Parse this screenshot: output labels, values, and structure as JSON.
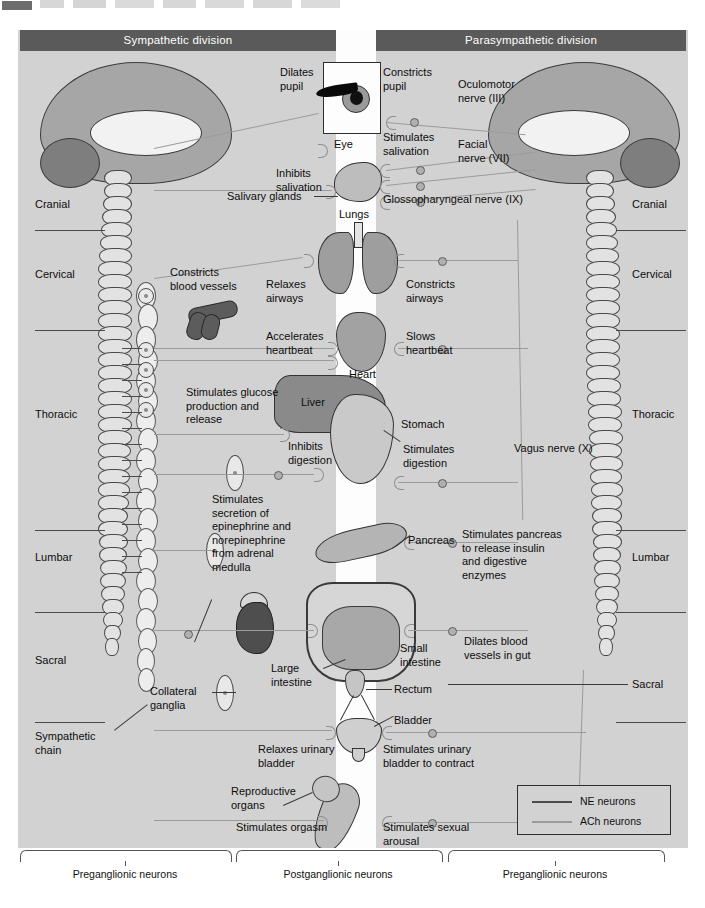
{
  "figure": {
    "banners": {
      "sympathetic": "Sympathetic division",
      "parasympathetic": "Parasympathetic division"
    },
    "spinal_regions_left": [
      "Cranial",
      "Cervical",
      "Thoracic",
      "Lumbar",
      "Sacral"
    ],
    "spinal_regions_right": [
      "Cranial",
      "Cervical",
      "Thoracic",
      "Lumbar",
      "Sacral"
    ],
    "structure_labels_left": {
      "sympathetic_chain": "Sympathetic\nchain",
      "collateral_ganglia": "Collateral\nganglia"
    },
    "organ_labels": [
      {
        "id": "eye",
        "text": "Eye"
      },
      {
        "id": "salivary-glands",
        "text": "Salivary glands"
      },
      {
        "id": "lungs",
        "text": "Lungs"
      },
      {
        "id": "heart",
        "text": "Heart"
      },
      {
        "id": "liver",
        "text": "Liver"
      },
      {
        "id": "stomach",
        "text": "Stomach"
      },
      {
        "id": "pancreas",
        "text": "Pancreas"
      },
      {
        "id": "small-intestine",
        "text": "Small\nintestine"
      },
      {
        "id": "large-intestine",
        "text": "Large\nintestine"
      },
      {
        "id": "rectum",
        "text": "Rectum"
      },
      {
        "id": "bladder",
        "text": "Bladder"
      },
      {
        "id": "reproductive-organs",
        "text": "Reproductive\norgans"
      }
    ],
    "sympathetic_effects": [
      {
        "id": "dilates-pupil",
        "text": "Dilates\npupil"
      },
      {
        "id": "inhibits-salivation",
        "text": "Inhibits\nsalivation"
      },
      {
        "id": "constricts-blood-vessels",
        "text": "Constricts\nblood vessels"
      },
      {
        "id": "relaxes-airways",
        "text": "Relaxes\nairways"
      },
      {
        "id": "accelerates-heartbeat",
        "text": "Accelerates\nheartbeat"
      },
      {
        "id": "stimulates-glucose",
        "text": "Stimulates glucose\nproduction and\nrelease"
      },
      {
        "id": "inhibits-digestion",
        "text": "Inhibits\ndigestion"
      },
      {
        "id": "stimulates-adrenal",
        "text": "Stimulates\nsecretion of\nepinephrine and\nnorepinephrine\nfrom adrenal\nmedulla"
      },
      {
        "id": "relaxes-urinary-bladder",
        "text": "Relaxes urinary\nbladder"
      },
      {
        "id": "stimulates-orgasm",
        "text": "Stimulates orgasm"
      }
    ],
    "parasympathetic_effects": [
      {
        "id": "constricts-pupil",
        "text": "Constricts\npupil"
      },
      {
        "id": "stimulates-salivation",
        "text": "Stimulates\nsalivation"
      },
      {
        "id": "constricts-airways",
        "text": "Constricts\nairways"
      },
      {
        "id": "slows-heartbeat",
        "text": "Slows\nheartbeat"
      },
      {
        "id": "stimulates-digestion",
        "text": "Stimulates\ndigestion"
      },
      {
        "id": "stimulates-pancreas",
        "text": "Stimulates pancreas\nto release insulin\nand digestive\nenzymes"
      },
      {
        "id": "dilates-blood-vessels-gut",
        "text": "Dilates blood\nvessels in gut"
      },
      {
        "id": "stimulates-bladder-contract",
        "text": "Stimulates urinary\nbladder to contract"
      },
      {
        "id": "stimulates-sexual-arousal",
        "text": "Stimulates sexual\narousal"
      }
    ],
    "cranial_nerves": [
      {
        "id": "oculomotor",
        "text": "Oculomotor\nnerve (III)"
      },
      {
        "id": "facial",
        "text": "Facial\nnerve (VII)"
      },
      {
        "id": "glossopharyngeal",
        "text": "Glossopharyngeal nerve (IX)"
      },
      {
        "id": "vagus",
        "text": "Vagus nerve (X)"
      }
    ],
    "legend": {
      "items": [
        {
          "id": "ne-neurons",
          "label": "NE neurons",
          "color": "#4b4b4b"
        },
        {
          "id": "ach-neurons",
          "label": "ACh neurons",
          "color": "#9b9b9b"
        }
      ]
    },
    "bottom_braces": [
      {
        "id": "preganglionic-left",
        "text": "Preganglionic\nneurons"
      },
      {
        "id": "postganglionic",
        "text": "Postganglionic\nneurons"
      },
      {
        "id": "preganglionic-right",
        "text": "Preganglionic\nneurons"
      }
    ],
    "colors": {
      "panel_bg": "#d2d2d2",
      "banner_bg": "#5a5a5a",
      "center_strip": "#fdfdfd",
      "ne_line": "#4b4b4b",
      "ach_line": "#9b9b9b"
    }
  }
}
